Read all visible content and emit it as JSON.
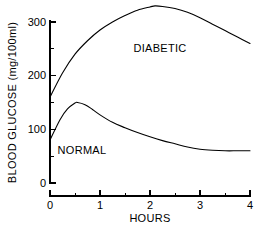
{
  "chart_data": {
    "type": "line",
    "title": "",
    "xlabel": "HOURS",
    "ylabel": "BLOOD GLUCOSE (mg/100ml)",
    "xlim": [
      0,
      4
    ],
    "ylim": [
      0,
      330
    ],
    "grid": false,
    "legend_position": "inline-annotations",
    "x_ticks": [
      "0",
      "1",
      "2",
      "3",
      "4"
    ],
    "x_tick_values": [
      0,
      1,
      2,
      3,
      4
    ],
    "x_minor_ticks": [
      0.5,
      1.5,
      2.5,
      3.5
    ],
    "y_ticks": [
      "0",
      "100",
      "200",
      "300"
    ],
    "y_tick_values": [
      0,
      100,
      200,
      300
    ],
    "y_minor_ticks": [
      50,
      150,
      250
    ],
    "series": [
      {
        "name": "DIABETIC",
        "label_x": 2.1,
        "label_y": 250,
        "x": [
          0,
          0.25,
          0.5,
          0.75,
          1.0,
          1.25,
          1.5,
          1.75,
          2.0,
          2.1,
          2.25,
          2.5,
          2.75,
          3.0,
          3.25,
          3.5,
          3.75,
          4.0
        ],
        "values": [
          160,
          205,
          240,
          265,
          285,
          300,
          312,
          322,
          328,
          330,
          329,
          325,
          318,
          308,
          296,
          284,
          272,
          260
        ]
      },
      {
        "name": "NORMAL",
        "label_x": 0.55,
        "label_y": 35,
        "x": [
          0,
          0.2,
          0.35,
          0.5,
          0.55,
          0.7,
          0.85,
          1.0,
          1.25,
          1.5,
          1.75,
          2.0,
          2.25,
          2.5,
          2.75,
          3.0,
          3.25,
          3.5,
          3.75,
          4.0
        ],
        "values": [
          80,
          118,
          138,
          149,
          150,
          146,
          137,
          127,
          113,
          103,
          94,
          86,
          79,
          73,
          67,
          63,
          61,
          60,
          60,
          60
        ]
      }
    ]
  },
  "annotations": {
    "diabetic_label": "DIABETIC",
    "normal_label": "NORMAL"
  },
  "axes": {
    "x_axis_title": "HOURS",
    "y_axis_title": "BLOOD GLUCOSE (mg/100ml)"
  },
  "colors": {
    "background": "#ffffff",
    "axis": "#000000",
    "curve": "#000000",
    "text": "#000000"
  }
}
